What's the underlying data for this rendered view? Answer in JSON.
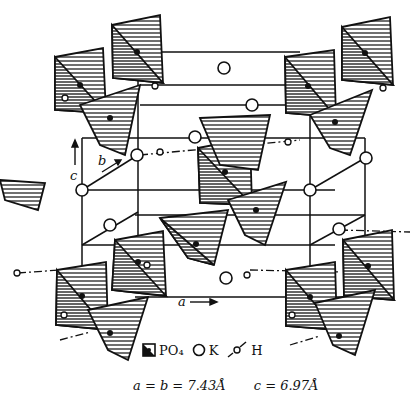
{
  "figure": {
    "axes": {
      "a_label": "a",
      "b_label": "b",
      "c_label": "c"
    },
    "legend": [
      {
        "symbol": "tetrahedron",
        "label": "PO₄"
      },
      {
        "symbol": "open-circle",
        "label": "K"
      },
      {
        "symbol": "dash-dot-bond",
        "label": "H"
      }
    ],
    "caption": {
      "ab": "a = b = 7.43Å",
      "c": "c = 6.97Å"
    },
    "colors": {
      "ink": "#111111",
      "background": "#ffffff"
    }
  }
}
